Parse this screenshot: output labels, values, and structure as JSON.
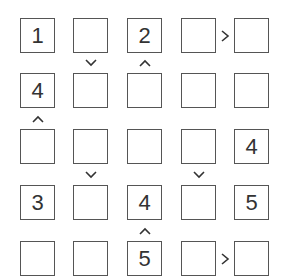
{
  "puzzle": {
    "type": "futoshiki",
    "size": 5,
    "grid": [
      [
        "1",
        "",
        "2",
        "",
        ""
      ],
      [
        "4",
        "",
        "",
        "",
        ""
      ],
      [
        "",
        "",
        "",
        "",
        "4"
      ],
      [
        "3",
        "",
        "4",
        "",
        "5"
      ],
      [
        "",
        "",
        "5",
        "",
        ""
      ]
    ],
    "horizontal_constraints": [
      {
        "row": 0,
        "col": 3,
        "symbol": ">"
      },
      {
        "row": 4,
        "col": 3,
        "symbol": ">"
      }
    ],
    "vertical_constraints": [
      {
        "row": 0,
        "col": 1,
        "symbol": "v"
      },
      {
        "row": 0,
        "col": 2,
        "symbol": "^"
      },
      {
        "row": 1,
        "col": 0,
        "symbol": "^"
      },
      {
        "row": 2,
        "col": 1,
        "symbol": "v"
      },
      {
        "row": 2,
        "col": 3,
        "symbol": "v"
      },
      {
        "row": 3,
        "col": 2,
        "symbol": "^"
      }
    ]
  }
}
